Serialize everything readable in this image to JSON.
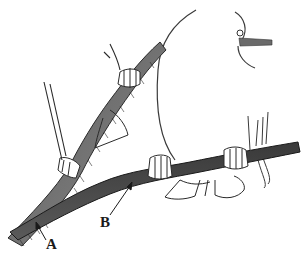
{
  "figure": {
    "labels": [
      {
        "id": "A",
        "text": "A",
        "points_to": "upper/left branch base"
      },
      {
        "id": "B",
        "text": "B",
        "points_to": "lower horizontal branch"
      }
    ],
    "colors": {
      "ink": "#2a2a2a",
      "branch_fill": "#4a4a4a",
      "branch_light": "#8a8a8a",
      "background": "#ffffff"
    }
  }
}
